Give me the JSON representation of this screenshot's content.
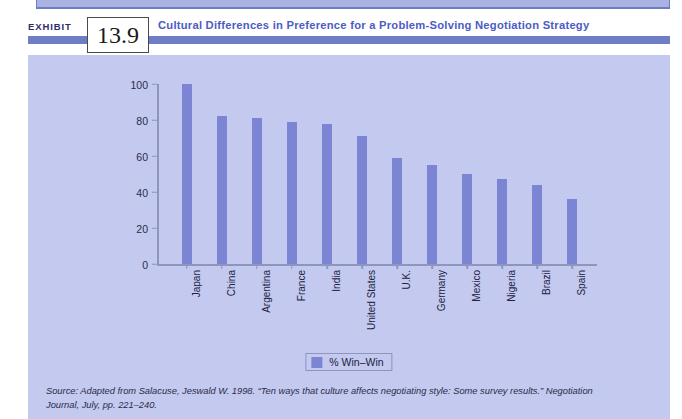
{
  "exhibit": {
    "word": "EXHIBIT",
    "number": "13.9",
    "title": "Cultural Differences in Preference for a Problem-Solving Negotiation Strategy"
  },
  "legend": {
    "label": "% Win–Win",
    "swatch_color": "#7b85d4",
    "position": "bottom-center"
  },
  "source": {
    "line1": "Source: Adapted from Salacuse, Jeswald W. 1998. “Ten ways that culture affects negotiating style: Some survey results.” Negotiation",
    "line2": "Journal, July, pp. 221–240."
  },
  "colors": {
    "panel_background": "#c3c9ef",
    "bar": "#7b85d4",
    "title_text": "#4b5cc4",
    "rule": "#6f7ec4",
    "axis": "#8e95bf"
  },
  "chart_data": {
    "type": "bar",
    "title": "Cultural Differences in Preference for a Problem-Solving Negotiation Strategy",
    "xlabel": "",
    "ylabel": "",
    "ylim": [
      0,
      100
    ],
    "yticks": [
      0,
      20,
      40,
      60,
      80,
      100
    ],
    "grid": false,
    "legend_position": "bottom-center",
    "categories": [
      "Japan",
      "China",
      "Argentina",
      "France",
      "India",
      "United States",
      "U.K.",
      "Germany",
      "Mexico",
      "Nigeria",
      "Brazil",
      "Spain"
    ],
    "series": [
      {
        "name": "% Win–Win",
        "values": [
          100,
          82,
          81,
          79,
          78,
          71,
          59,
          55,
          50,
          47,
          44,
          36
        ]
      }
    ]
  }
}
